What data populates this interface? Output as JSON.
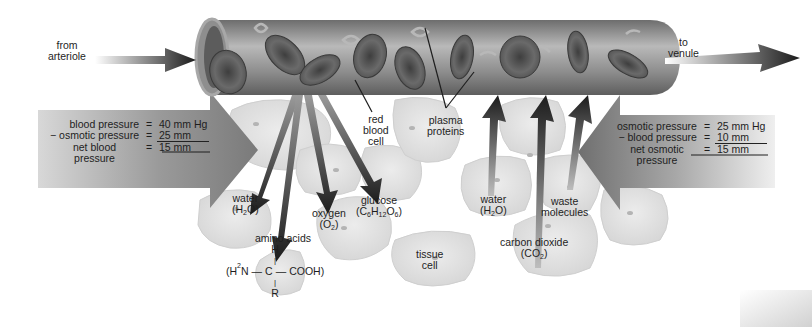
{
  "diagram": {
    "flow_labels": {
      "inflow": "from arteriole",
      "inflow_lines": [
        "from",
        "arteriole"
      ],
      "outflow_lines": [
        "to",
        "venule"
      ]
    },
    "arterial_end": {
      "rows": [
        {
          "key": "blood pressure",
          "op": "=",
          "value": "40 mm Hg"
        },
        {
          "key": "− osmotic pressure",
          "op": "=",
          "value": "25 mm"
        },
        {
          "key": "net blood",
          "op": "=",
          "value": "15 mm"
        },
        {
          "key": "pressure",
          "op": "",
          "value": ""
        }
      ]
    },
    "venous_end": {
      "rows": [
        {
          "key": "osmotic pressure",
          "op": "=",
          "value": "25 mm Hg"
        },
        {
          "key": "− blood pressure",
          "op": "=",
          "value": "10 mm"
        },
        {
          "key": "net osmotic",
          "op": "=",
          "value": "15 mm"
        },
        {
          "key": "pressure",
          "op": "",
          "value": ""
        }
      ]
    },
    "structure_labels": {
      "red_blood_cell": [
        "red",
        "blood",
        "cell"
      ],
      "plasma_proteins": [
        "plasma",
        "proteins"
      ],
      "tissue_cell": [
        "tissue",
        "cell"
      ]
    },
    "outgoing_substances": {
      "water": {
        "name": "water",
        "formula_pre": "(H",
        "formula_sub": "2",
        "formula_post": "O)"
      },
      "oxygen": {
        "name": "oxygen",
        "formula_pre": "(O",
        "formula_sub": "2",
        "formula_post": ")"
      },
      "glucose": {
        "name": "glucose",
        "f1": "(C",
        "s1": "6",
        "f2": "H",
        "s2": "12",
        "f3": "O",
        "s3": "6",
        "f4": ")"
      },
      "amino_acids": {
        "name": "amino acids",
        "top": "H",
        "bond_v": "|",
        "left_pre": "(H",
        "left_sub": "2",
        "left_post": "N",
        "dash": "—",
        "center": "C",
        "right": "COOH)",
        "bottom": "R"
      }
    },
    "incoming_substances": {
      "water": {
        "name": "water",
        "formula_pre": "(H",
        "formula_sub": "2",
        "formula_post": "O)"
      },
      "carbon_dioxide": {
        "name": "carbon dioxide",
        "formula_pre": "(CO",
        "formula_sub": "2",
        "formula_post": ")"
      },
      "waste": {
        "name": "waste",
        "name2": "molecules"
      }
    },
    "colors": {
      "arrow_dark": "#1f1f1f",
      "pressure_arrow": "#8a8a8a",
      "capillary": "#7d7d7d",
      "rbc": "#5a5a5a",
      "tissue_cell": "#e4e4e4",
      "tissue_outline": "#c9c9c9"
    }
  }
}
